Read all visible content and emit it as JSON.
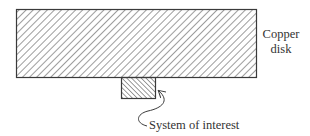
{
  "diagram": {
    "disk_label_line1": "Copper",
    "disk_label_line2": "disk",
    "system_label": "System of interest",
    "colors": {
      "stroke": "#3a3a3a",
      "hatch": "#4a4a4a",
      "text": "#333333",
      "background": "#ffffff"
    }
  }
}
